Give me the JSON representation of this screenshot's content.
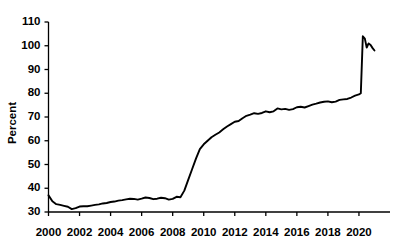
{
  "chart_data": {
    "type": "line",
    "title": "",
    "subtitle": "",
    "xlabel": "",
    "ylabel": "Percent",
    "xlim": [
      2000.0,
      2022.0
    ],
    "ylim": [
      30,
      110
    ],
    "grid": false,
    "legend": null,
    "legend_position": "none",
    "x_ticks": [
      2000,
      2002,
      2004,
      2006,
      2008,
      2010,
      2012,
      2014,
      2016,
      2018,
      2020
    ],
    "x_tick_labels": [
      "2000",
      "2002",
      "2004",
      "2006",
      "2008",
      "2010",
      "2012",
      "2014",
      "2016",
      "2018",
      "2020"
    ],
    "y_ticks": [
      30,
      40,
      50,
      60,
      70,
      80,
      90,
      100,
      110
    ],
    "y_tick_labels": [
      "30",
      "40",
      "50",
      "60",
      "70",
      "80",
      "90",
      "100",
      "110"
    ],
    "line_color": "#000000",
    "background_color": "#ffffff",
    "series": [
      {
        "name": "Percent",
        "x": [
          2000.0,
          2000.25,
          2000.5,
          2000.75,
          2001.0,
          2001.25,
          2001.5,
          2001.75,
          2002.0,
          2002.25,
          2002.5,
          2002.75,
          2003.0,
          2003.25,
          2003.5,
          2003.75,
          2004.0,
          2004.25,
          2004.5,
          2004.75,
          2005.0,
          2005.25,
          2005.5,
          2005.75,
          2006.0,
          2006.25,
          2006.5,
          2006.75,
          2007.0,
          2007.25,
          2007.5,
          2007.75,
          2008.0,
          2008.25,
          2008.5,
          2008.75,
          2009.0,
          2009.25,
          2009.5,
          2009.75,
          2010.0,
          2010.25,
          2010.5,
          2010.75,
          2011.0,
          2011.25,
          2011.5,
          2011.75,
          2012.0,
          2012.25,
          2012.5,
          2012.75,
          2013.0,
          2013.25,
          2013.5,
          2013.75,
          2014.0,
          2014.25,
          2014.5,
          2014.75,
          2015.0,
          2015.25,
          2015.5,
          2015.75,
          2016.0,
          2016.25,
          2016.5,
          2016.75,
          2017.0,
          2017.25,
          2017.5,
          2017.75,
          2018.0,
          2018.25,
          2018.5,
          2018.75,
          2019.0,
          2019.25,
          2019.5,
          2019.75,
          2020.0,
          2020.12,
          2020.25,
          2020.38,
          2020.5,
          2020.62,
          2020.75,
          2020.88,
          2021.0
        ],
        "y": [
          37.0,
          34.5,
          33.3,
          33.0,
          32.6,
          32.2,
          31.2,
          31.6,
          32.3,
          32.4,
          32.4,
          32.7,
          33.0,
          33.2,
          33.6,
          33.8,
          34.2,
          34.4,
          34.8,
          35.0,
          35.3,
          35.6,
          35.5,
          35.2,
          35.6,
          36.1,
          35.9,
          35.4,
          35.6,
          36.0,
          35.8,
          35.2,
          35.5,
          36.4,
          36.2,
          39.0,
          43.5,
          48.0,
          52.5,
          56.5,
          58.5,
          60.0,
          61.5,
          62.5,
          63.5,
          64.8,
          66.0,
          67.0,
          68.0,
          68.3,
          69.5,
          70.5,
          71.0,
          71.6,
          71.3,
          71.7,
          72.4,
          72.0,
          72.4,
          73.6,
          73.2,
          73.4,
          73.0,
          73.3,
          74.1,
          74.3,
          74.0,
          74.6,
          75.2,
          75.6,
          76.1,
          76.4,
          76.6,
          76.2,
          76.5,
          77.2,
          77.4,
          77.6,
          78.2,
          79.0,
          79.5,
          80.0,
          104.0,
          103.0,
          99.2,
          101.0,
          100.3,
          99.0,
          98.0
        ]
      }
    ]
  }
}
